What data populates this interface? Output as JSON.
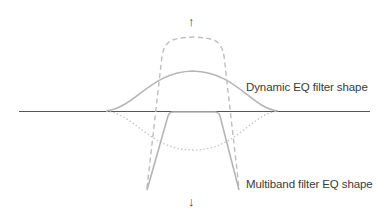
{
  "diagram": {
    "title": "",
    "labels": {
      "dynamic": "Dynamic EQ filter shape",
      "multiband": "Multiband filter EQ shape"
    },
    "arrows": {
      "up": "↑",
      "down": "↓"
    },
    "colors": {
      "baseline": "#555555",
      "curve": "#b5b5b5",
      "dashed": "#bdbdbd",
      "dotted": "#c4c4c4",
      "text": "#3a3a3a"
    }
  }
}
